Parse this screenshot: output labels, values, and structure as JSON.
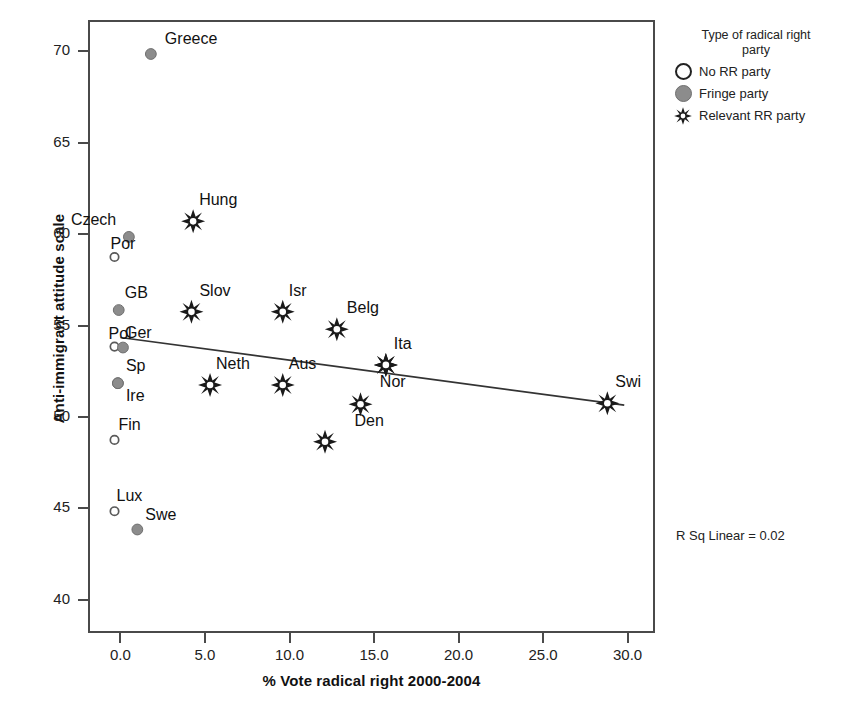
{
  "chart_data": {
    "type": "scatter",
    "title": "",
    "xlabel": "% Vote radical right 2000-2004",
    "ylabel": "Anti-immigrant attitude scale",
    "xlim": [
      -1.8,
      31.5
    ],
    "ylim": [
      38.3,
      71.6
    ],
    "xticks": [
      "0.0",
      "5.0",
      "10.0",
      "15.0",
      "20.0",
      "25.0",
      "30.0"
    ],
    "xtick_values": [
      0,
      5,
      10,
      15,
      20,
      25,
      30
    ],
    "yticks": [
      "70",
      "65",
      "60",
      "55",
      "50",
      "45",
      "40"
    ],
    "ytick_values": [
      70,
      65,
      60,
      55,
      50,
      45,
      40
    ],
    "grid": false,
    "annotation": "R Sq Linear = 0.02",
    "legend_position": "outside-top-right",
    "trendline": {
      "type": "linear",
      "x_start": 0.0,
      "y_start": 54.35,
      "x_end": 29.8,
      "y_end": 50.65,
      "r_squared": 0.02
    },
    "series": [
      {
        "name": "No RR party",
        "marker": "open-circle",
        "points": [
          {
            "label": "Por",
            "x": -0.35,
            "y": 58.75,
            "label_dx": -4,
            "label_dy": -22
          },
          {
            "label": "Pol",
            "x": -0.35,
            "y": 53.85,
            "label_dx": -6,
            "label_dy": -22
          },
          {
            "label": "Fin",
            "x": -0.35,
            "y": 48.75,
            "label_dx": 4,
            "label_dy": -24
          },
          {
            "label": "Lux",
            "x": -0.35,
            "y": 44.85,
            "label_dx": 2,
            "label_dy": -24
          }
        ]
      },
      {
        "name": "Fringe party",
        "marker": "filled-circle",
        "points": [
          {
            "label": "Greece",
            "x": 1.8,
            "y": 69.85,
            "label_dx": 14,
            "label_dy": -24
          },
          {
            "label": "Czech",
            "x": 0.5,
            "y": 59.85,
            "label_dx": -58,
            "label_dy": -26
          },
          {
            "label": "GB",
            "x": -0.1,
            "y": 55.85,
            "label_dx": 6,
            "label_dy": -26
          },
          {
            "label": "Ger",
            "x": 0.15,
            "y": 53.8,
            "label_dx": 2,
            "label_dy": -24
          },
          {
            "label": "Sp",
            "x": -0.15,
            "y": 51.85,
            "label_dx": 8,
            "label_dy": -26
          },
          {
            "label": "Ire",
            "x": -0.15,
            "y": 51.85,
            "label_dx": 8,
            "label_dy": 4
          },
          {
            "label": "Swe",
            "x": 1.0,
            "y": 43.85,
            "label_dx": 8,
            "label_dy": -24
          }
        ]
      },
      {
        "name": "Relevant RR party",
        "marker": "star",
        "points": [
          {
            "label": "Hung",
            "x": 4.3,
            "y": 60.7,
            "label_dx": 6,
            "label_dy": -30
          },
          {
            "label": "Slov",
            "x": 4.2,
            "y": 55.75,
            "label_dx": 8,
            "label_dy": -30
          },
          {
            "label": "Isr",
            "x": 9.6,
            "y": 55.75,
            "label_dx": 6,
            "label_dy": -30
          },
          {
            "label": "Belg",
            "x": 12.8,
            "y": 54.8,
            "label_dx": 10,
            "label_dy": -30
          },
          {
            "label": "Neth",
            "x": 5.3,
            "y": 51.75,
            "label_dx": 6,
            "label_dy": -30
          },
          {
            "label": "Aus",
            "x": 9.6,
            "y": 51.75,
            "label_dx": 6,
            "label_dy": -30
          },
          {
            "label": "Ita",
            "x": 15.7,
            "y": 52.85,
            "label_dx": 8,
            "label_dy": -30
          },
          {
            "label": "Nor",
            "x": 15.7,
            "y": 52.85,
            "label_dx": -6,
            "label_dy": 8
          },
          {
            "label": "Den",
            "x": 14.2,
            "y": 50.7,
            "label_dx": -6,
            "label_dy": 8
          },
          {
            "label": "Den2",
            "x": 12.1,
            "y": 48.65,
            "label_dx": 0,
            "label_dy": 0
          },
          {
            "label": "Swi",
            "x": 28.8,
            "y": 50.75,
            "label_dx": 8,
            "label_dy": -30
          }
        ]
      }
    ]
  },
  "axes": {
    "x_title": "% Vote radical right 2000-2004",
    "y_title": "Anti-immigrant attitude scale",
    "x_tick_labels": [
      "0.0",
      "5.0",
      "10.0",
      "15.0",
      "20.0",
      "25.0",
      "30.0"
    ],
    "y_tick_labels": [
      "70",
      "65",
      "60",
      "55",
      "50",
      "45",
      "40"
    ]
  },
  "legend": {
    "title_line1": "Type of radical right",
    "title_line2": "party",
    "items": [
      {
        "symbol": "open-circle",
        "label": "No RR party"
      },
      {
        "symbol": "filled-circle",
        "label": "Fringe party"
      },
      {
        "symbol": "star",
        "label": "Relevant RR party"
      }
    ]
  },
  "annotation": {
    "r_sq_linear": "R Sq Linear = 0.02"
  },
  "colors": {
    "frame": "#4a4a4a",
    "fringe_marker": "#8c8c8c",
    "open_marker_stroke": "#5a5a5a",
    "text": "#1a1a1a",
    "trendline": "#333333"
  }
}
